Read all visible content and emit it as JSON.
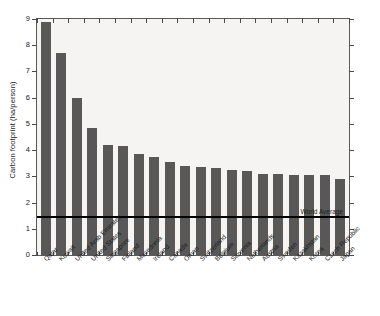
{
  "chart_data": {
    "type": "bar",
    "title": "",
    "xlabel": "",
    "ylabel": "Carbon footprint (ha/person)",
    "ylim": [
      0,
      9
    ],
    "yticks": [
      0,
      1,
      2,
      3,
      4,
      5,
      6,
      7,
      8,
      9
    ],
    "grid": false,
    "legend": "none",
    "bar_color": "#585858",
    "plot_background": "#f5f4f2",
    "categories": [
      "Qatar",
      "Kuwait",
      "United Arab Emirates",
      "United States",
      "Singapore",
      "Finland",
      "Macedonia",
      "Ireland",
      "Canada",
      "Oman",
      "Switzerland",
      "Belgium",
      "Slovenia",
      "Netherlands",
      "Austria",
      "Sweden",
      "Kazakhstan",
      "Korea",
      "Czech Republic",
      "Japan"
    ],
    "values": [
      8.9,
      7.7,
      6.0,
      4.85,
      4.2,
      4.15,
      3.85,
      3.75,
      3.55,
      3.4,
      3.35,
      3.3,
      3.25,
      3.2,
      3.1,
      3.1,
      3.05,
      3.05,
      3.05,
      2.9
    ],
    "annotations": [
      {
        "name": "world-average",
        "label": "World Average",
        "value": 1.5,
        "type": "horizontal-line",
        "color": "#000000"
      }
    ]
  }
}
